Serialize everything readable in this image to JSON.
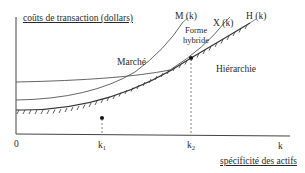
{
  "diagram": {
    "y_axis_label": "coûts de transaction (dollars)",
    "x_axis_label": "spécificité des actifs",
    "x_axis_symbol": "k",
    "origin_label": "0",
    "ticks": [
      {
        "base": "k",
        "sub": "1"
      },
      {
        "base": "k",
        "sub": "2"
      }
    ],
    "curves": [
      {
        "id": "M",
        "label": "M (k)",
        "region_label": "Marché"
      },
      {
        "id": "X",
        "label": "X (k)",
        "region_label": "Forme hybride",
        "region_label_lines": [
          "Forme",
          "hybride"
        ]
      },
      {
        "id": "H",
        "label": "H (k)",
        "region_label": "Hiérarchie",
        "style": "hatched"
      }
    ],
    "colors": {
      "line": "#333333",
      "text": "#2a2a2a",
      "background": "#ffffff"
    }
  }
}
